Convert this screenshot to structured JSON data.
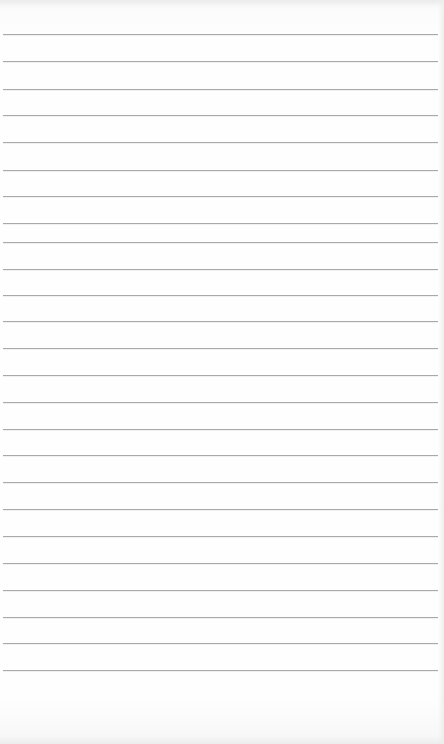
{
  "page": {
    "type": "ruled-notepad-sheet",
    "paper_color": "#fdfdfd",
    "rule_color": "#a9a9a9",
    "rule_left": 3,
    "rule_right": 438,
    "rules_y": [
      34,
      61,
      89,
      115,
      142,
      170,
      196,
      223,
      242,
      269,
      295,
      321,
      348,
      375,
      402,
      429,
      455,
      482,
      509,
      536,
      563,
      590,
      617,
      643,
      670
    ],
    "text": []
  }
}
